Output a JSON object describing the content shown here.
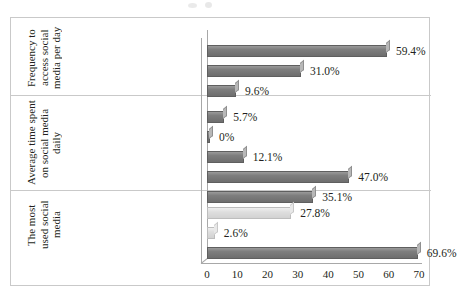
{
  "chart_data": {
    "type": "bar",
    "orientation": "horizontal",
    "title": "",
    "xlabel": "",
    "ylabel": "",
    "xlim": [
      0,
      70
    ],
    "xticks": [
      "0",
      "10",
      "20",
      "30",
      "40",
      "50",
      "60",
      "70"
    ],
    "grid": false,
    "legend": "none",
    "value_suffix": "%",
    "groups": [
      {
        "group_label": "Frequency\nto access\nsocial\nmedia per\nday",
        "categories": [
          "Above 6 times",
          "4 – 6 times",
          "1 – 3 times"
        ],
        "values": [
          59.4,
          31.0,
          9.6
        ],
        "value_labels": [
          "59.4%",
          "31.0%",
          "9.6%"
        ],
        "colors": [
          "#7e7e7e",
          "#7e7e7e",
          "#7e7e7e"
        ]
      },
      {
        "group_label": "Average time\nspent on social\nmedia daily",
        "categories": [
          "Above 10 hours",
          "8 – 10 hours",
          "5 – 7 hours",
          "2 – 4 hours",
          "Less than 2 hours"
        ],
        "values": [
          5.7,
          0,
          12.1,
          47.0,
          35.1
        ],
        "value_labels": [
          "5.7%",
          "0%",
          "12.1%",
          "47.0%",
          "35.1%"
        ],
        "colors": [
          "#7e7e7e",
          "#7e7e7e",
          "#7e7e7e",
          "#7e7e7e",
          "#7e7e7e"
        ]
      },
      {
        "group_label": "The most\nused social\nmedia",
        "categories": [
          "Instagram",
          "Twitter",
          "Facebook"
        ],
        "values": [
          27.8,
          2.6,
          69.6
        ],
        "value_labels": [
          "27.8%",
          "2.6%",
          "69.6%"
        ],
        "colors": [
          "#dedede",
          "#dedede",
          "#6e6e6e"
        ]
      }
    ]
  },
  "axis": {
    "ticks": [
      "0",
      "10",
      "20",
      "30",
      "40",
      "50",
      "60",
      "70"
    ]
  },
  "rows": [
    {
      "label": "Above 6 times",
      "value_label": "59.4%",
      "value": 59.4,
      "shade": "dark"
    },
    {
      "label": "4 – 6 times",
      "value_label": "31.0%",
      "value": 31.0,
      "shade": "dark"
    },
    {
      "label": "1 – 3 times",
      "value_label": "9.6%",
      "value": 9.6,
      "shade": "dark"
    },
    {
      "label": "Above 10 hours",
      "value_label": "5.7%",
      "value": 5.7,
      "shade": "dark"
    },
    {
      "label": "8 – 10 hours",
      "value_label": "0%",
      "value": 0.35,
      "shade": "dark"
    },
    {
      "label": "5 – 7 hours",
      "value_label": "12.1%",
      "value": 12.1,
      "shade": "dark"
    },
    {
      "label": "2 – 4 hours",
      "value_label": "47.0%",
      "value": 47.0,
      "shade": "dark"
    },
    {
      "label": "Less than 2 hours",
      "value_label": "35.1%",
      "value": 35.1,
      "shade": "dark"
    },
    {
      "label": "Instagram",
      "value_label": "27.8%",
      "value": 27.8,
      "shade": "light"
    },
    {
      "label": "Twitter",
      "value_label": "2.6%",
      "value": 2.6,
      "shade": "light"
    },
    {
      "label": "Facebook",
      "value_label": "69.6%",
      "value": 69.6,
      "shade": "dark"
    }
  ],
  "group_titles": [
    "Frequency to access social media per day",
    "Average time spent on social media daily",
    "The most used social media"
  ]
}
